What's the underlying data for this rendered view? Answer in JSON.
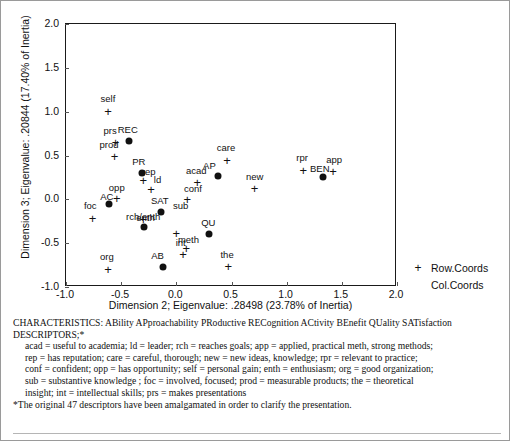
{
  "chart_data": {
    "type": "scatter",
    "title": "",
    "xlabel": "Dimension 2; Eigenvalue: .28498 (23.78% of Inertia)",
    "ylabel": "Dimension 3; Eigenvalue: .20844 (17.40% of Inertia)",
    "xlim": [
      -1.0,
      2.0
    ],
    "ylim": [
      -1.0,
      2.0
    ],
    "xticks": [
      "-1.0",
      "-0.5",
      "0.0",
      "0.5",
      "1.0",
      "1.5",
      "2.0"
    ],
    "xtick_values": [
      -1.0,
      -0.5,
      0.0,
      0.5,
      1.0,
      1.5,
      2.0
    ],
    "yticks": [
      "-1.0",
      "-0.5",
      "0.0",
      "0.5",
      "1.0",
      "1.5",
      "2.0"
    ],
    "ytick_values": [
      -1.0,
      -0.5,
      0.0,
      0.5,
      1.0,
      1.5,
      2.0
    ],
    "grid": false,
    "legend_position": "right-bottom-outside",
    "series": [
      {
        "name": "Row.Coords",
        "marker": "plus",
        "points": [
          {
            "label": "self",
            "x": -0.62,
            "y": 1.01,
            "lx": -0.62,
            "ly": 1.14
          },
          {
            "label": "prs",
            "x": -0.55,
            "y": 0.65,
            "lx": -0.6,
            "ly": 0.78
          },
          {
            "label": "prod",
            "x": -0.56,
            "y": 0.49,
            "lx": -0.61,
            "ly": 0.62
          },
          {
            "label": "care",
            "x": 0.46,
            "y": 0.45,
            "lx": 0.45,
            "ly": 0.58
          },
          {
            "label": "rpr",
            "x": 1.15,
            "y": 0.34,
            "lx": 1.14,
            "ly": 0.47
          },
          {
            "label": "app",
            "x": 1.42,
            "y": 0.32,
            "lx": 1.43,
            "ly": 0.45
          },
          {
            "label": "rep",
            "x": -0.3,
            "y": 0.22,
            "lx": -0.25,
            "ly": 0.31
          },
          {
            "label": "ld",
            "x": -0.23,
            "y": 0.12,
            "lx": -0.17,
            "ly": 0.22
          },
          {
            "label": "acad",
            "x": 0.19,
            "y": 0.2,
            "lx": 0.18,
            "ly": 0.32
          },
          {
            "label": "conf",
            "x": 0.1,
            "y": 0.0,
            "lx": 0.15,
            "ly": 0.12
          },
          {
            "label": "opp",
            "x": -0.54,
            "y": 0.02,
            "lx": -0.54,
            "ly": 0.13
          },
          {
            "label": "new",
            "x": 0.71,
            "y": 0.13,
            "lx": 0.71,
            "ly": 0.25
          },
          {
            "label": "foc",
            "x": -0.76,
            "y": -0.21,
            "lx": -0.78,
            "ly": -0.08
          },
          {
            "label": "rch/enth",
            "x": -0.3,
            "y": -0.22,
            "lx": -0.3,
            "ly": -0.2
          },
          {
            "label": "sub",
            "x": 0.0,
            "y": -0.38,
            "lx": 0.04,
            "ly": -0.08
          },
          {
            "label": "meth",
            "x": 0.09,
            "y": -0.56,
            "lx": 0.11,
            "ly": -0.46
          },
          {
            "label": "int",
            "x": 0.06,
            "y": -0.62,
            "lx": 0.04,
            "ly": -0.5
          },
          {
            "label": "the",
            "x": 0.47,
            "y": -0.76,
            "lx": 0.46,
            "ly": -0.64
          },
          {
            "label": "org",
            "x": -0.62,
            "y": -0.79,
            "lx": -0.63,
            "ly": -0.66
          }
        ]
      },
      {
        "name": "Col.Coords",
        "marker": "dot",
        "points": [
          {
            "label": "REC",
            "x": -0.43,
            "y": 0.67,
            "lx": -0.44,
            "ly": 0.79
          },
          {
            "label": "PR",
            "x": -0.31,
            "y": 0.3,
            "lx": -0.34,
            "ly": 0.43
          },
          {
            "label": "AP",
            "x": 0.38,
            "y": 0.27,
            "lx": 0.3,
            "ly": 0.38
          },
          {
            "label": "BEN",
            "x": 1.33,
            "y": 0.26,
            "lx": 1.3,
            "ly": 0.35
          },
          {
            "label": "AC",
            "x": -0.61,
            "y": -0.05,
            "lx": -0.63,
            "ly": 0.03
          },
          {
            "label": "SAT",
            "x": -0.14,
            "y": -0.14,
            "lx": -0.15,
            "ly": -0.02
          },
          {
            "label": "enth",
            "x": -0.29,
            "y": -0.31,
            "lx": -0.28,
            "ly": -0.21
          },
          {
            "label": "QU",
            "x": 0.3,
            "y": -0.4,
            "lx": 0.29,
            "ly": -0.27
          },
          {
            "label": "AB",
            "x": -0.12,
            "y": -0.77,
            "lx": -0.17,
            "ly": -0.65
          }
        ]
      }
    ]
  },
  "legend": {
    "entries": [
      {
        "label": "Row.Coords",
        "marker": "plus"
      },
      {
        "label": "Col.Coords",
        "marker": "dot"
      }
    ]
  },
  "caption": {
    "characteristics": "CHARACTERISTICS: ABility APproachability PRoductive RECognition ACtivity BEnefit QUality SATisfaction",
    "descriptors_heading": "DESCRIPTORS;*",
    "line1": "acad = useful to academia; ld = leader; rch = reaches goals; app = applied, practical meth, strong methods;",
    "line2": "rep = has reputation; care = careful, thorough; new = new ideas, knowledge; rpr = relevant to practice;",
    "line3": "conf = confident; opp = has opportunity; self = personal gain; enth = enthusiasm; org = good organization;",
    "line4": "sub = substantive knowledge ; foc = involved, focused; prod = measurable products; the = theoretical",
    "line5": "insight; int = intellectual skills; prs = makes presentations",
    "footnote": "*The original 47 descriptors have been amalgamated in order to clarify the presentation."
  }
}
